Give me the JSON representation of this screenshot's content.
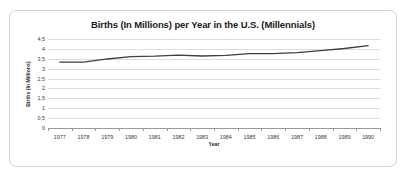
{
  "chart_data": {
    "type": "line",
    "title": "Births (In Millions) per Year in the U.S. (Millennials)",
    "xlabel": "Year",
    "ylabel": "Births (In Millions)",
    "categories": [
      "1977",
      "1978",
      "1979",
      "1980",
      "1981",
      "1982",
      "1983",
      "1984",
      "1985",
      "1986",
      "1987",
      "1988",
      "1989",
      "1990"
    ],
    "series": [
      {
        "name": "Births (In Millions)",
        "values": [
          3.33,
          3.33,
          3.49,
          3.61,
          3.63,
          3.68,
          3.64,
          3.67,
          3.76,
          3.76,
          3.81,
          3.91,
          4.02,
          4.16
        ],
        "color": "#3f3f3f"
      }
    ],
    "ylim": [
      0,
      4.5
    ],
    "ytick_values": [
      0,
      0.5,
      1,
      1.5,
      2,
      2.5,
      3,
      3.5,
      4,
      4.5
    ],
    "ytick_labels": [
      "0",
      "0,5",
      "1",
      "1,5",
      "2",
      "2,5",
      "3",
      "3,5",
      "4",
      "4,5"
    ],
    "grid": true,
    "legend": false,
    "legend_position": "none",
    "gridline_color": "#dcdcdc",
    "axis_color": "#9a9a9a",
    "background_color": "#ffffff",
    "border_color": "#d2d2d2"
  }
}
